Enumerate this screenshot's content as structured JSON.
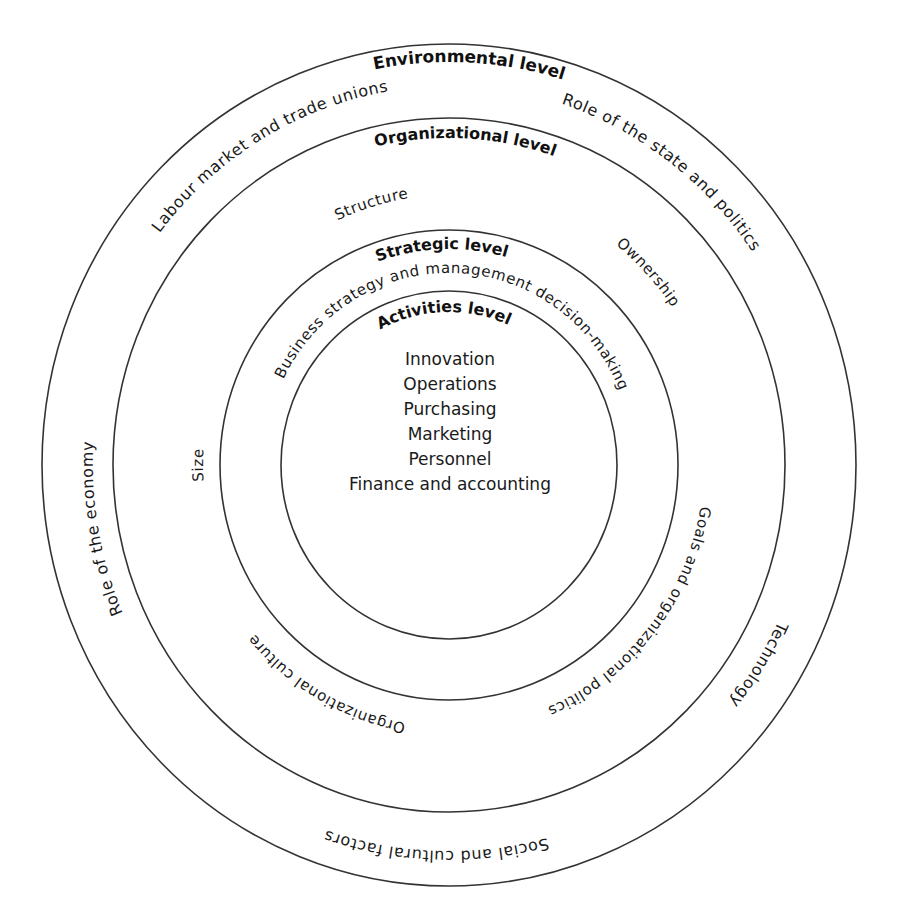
{
  "diagram": {
    "center": {
      "cx": 449,
      "cy": 465
    },
    "rings": [
      {
        "name": "environmental-ring",
        "rx": 407,
        "ry": 421
      },
      {
        "name": "organizational-ring",
        "rx": 336,
        "ry": 347
      },
      {
        "name": "strategic-ring",
        "rx": 229,
        "ry": 235
      },
      {
        "name": "activities-ring",
        "rx": 168,
        "ry": 174
      }
    ],
    "labels": [
      {
        "id": "environmental-level-title",
        "text": "Environmental level",
        "rx": 389,
        "ry": 403,
        "angle": 3,
        "size": 17,
        "bold": true
      },
      {
        "id": "labour-market-label",
        "text": "Labour market and trade unions",
        "rx": 366,
        "ry": 379,
        "angle": -31,
        "size": 16,
        "bold": false
      },
      {
        "id": "role-of-state-label",
        "text": "Role of the state and politics",
        "rx": 366,
        "ry": 379,
        "angle": 37,
        "size": 16,
        "bold": false
      },
      {
        "id": "role-of-economy-label",
        "text": "Role of the economy",
        "rx": 356,
        "ry": 368,
        "angle": -100,
        "size": 16,
        "bold": false
      },
      {
        "id": "technology-label",
        "text": "Technology",
        "rx": 362,
        "ry": 374,
        "angle": 122,
        "size": 16,
        "bold": false
      },
      {
        "id": "social-cultural-label",
        "text": "Social and cultural factors",
        "rx": 374,
        "ry": 386,
        "angle": 182,
        "size": 16,
        "bold": false
      },
      {
        "id": "organizational-level-title",
        "text": "Organizational level",
        "rx": 316,
        "ry": 327,
        "angle": 3,
        "size": 16,
        "bold": true
      },
      {
        "id": "structure-label",
        "text": "Structure",
        "rx": 262,
        "ry": 270,
        "angle": -17,
        "size": 15,
        "bold": false
      },
      {
        "id": "ownership-label",
        "text": "Ownership",
        "rx": 270,
        "ry": 280,
        "angle": 47,
        "size": 15,
        "bold": false
      },
      {
        "id": "size-label",
        "text": "Size",
        "rx": 246,
        "ry": 254,
        "angle": -90,
        "size": 15,
        "bold": false
      },
      {
        "id": "goals-politics-label",
        "text": "Goals and organizational politics",
        "rx": 254,
        "ry": 262,
        "angle": 128,
        "size": 15,
        "bold": false
      },
      {
        "id": "org-culture-label",
        "text": "Organizational culture",
        "rx": 254,
        "ry": 262,
        "angle": 210,
        "size": 15,
        "bold": false
      },
      {
        "id": "strategic-level-title",
        "text": "Strategic level",
        "rx": 210,
        "ry": 216,
        "angle": -2,
        "size": 16,
        "bold": true
      },
      {
        "id": "business-strategy-label",
        "text": "Business strategy and management decision-making",
        "rx": 184,
        "ry": 192,
        "angle": 2,
        "size": 15,
        "bold": false
      },
      {
        "id": "activities-level-title",
        "text": "Activities level",
        "rx": 148,
        "ry": 153,
        "angle": -2,
        "size": 16,
        "bold": true
      }
    ],
    "activities": {
      "items": [
        "Innovation",
        "Operations",
        "Purchasing",
        "Marketing",
        "Personnel",
        "Finance and accounting"
      ],
      "x": 450,
      "first_baseline": 365,
      "line_height": 25,
      "size": 17
    },
    "colors": {
      "line": "#333333",
      "text": "#1a1a1a",
      "background": "#ffffff"
    }
  }
}
